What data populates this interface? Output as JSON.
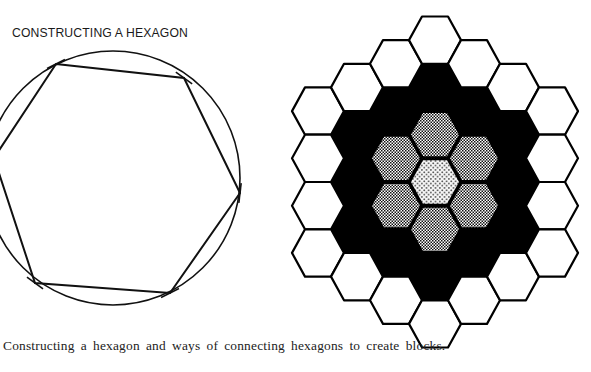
{
  "figure": {
    "title": "CONSTRUCTING A HEXAGON",
    "caption": "Constructing a hexagon and ways of connecting hexagons to create blocks.",
    "construction": {
      "circle": {
        "cx": 113,
        "cy": 178,
        "r": 127
      },
      "hexagon_vertices": [
        [
          56,
          64
        ],
        [
          184,
          78
        ],
        [
          240,
          193
        ],
        [
          170,
          293
        ],
        [
          35,
          283
        ],
        [
          -6,
          158
        ]
      ],
      "stroke": "#111111"
    },
    "hex_block": {
      "center": [
        435,
        182
      ],
      "col_step": 39,
      "row_step": 47.3,
      "radius": 26,
      "rings": [
        {
          "ring": 0,
          "fill": "dots",
          "label": "center"
        },
        {
          "ring": 1,
          "fill": "checker",
          "label": "inner ring"
        },
        {
          "ring": 2,
          "fill": "#000000",
          "label": "black ring"
        },
        {
          "ring": 3,
          "fill": "#ffffff",
          "label": "outer ring"
        }
      ],
      "colors": {
        "ink": "#000000",
        "paper": "#ffffff"
      }
    }
  }
}
